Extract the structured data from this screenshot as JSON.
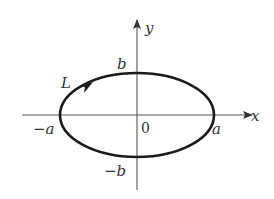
{
  "figure": {
    "type": "ellipse-contour",
    "axes": {
      "x_label": "x",
      "y_label": "y",
      "origin_label": "0"
    },
    "ellipse": {
      "semi_major_label_pos": "a",
      "semi_major_label_neg": "−a",
      "semi_minor_label_pos": "b",
      "semi_minor_label_neg": "−b",
      "orientation": "counterclockwise"
    },
    "curve_label": "L",
    "colors": {
      "stroke": "#1a1a1a",
      "axis": "#444444",
      "text": "#333333",
      "background": "#ffffff"
    }
  }
}
